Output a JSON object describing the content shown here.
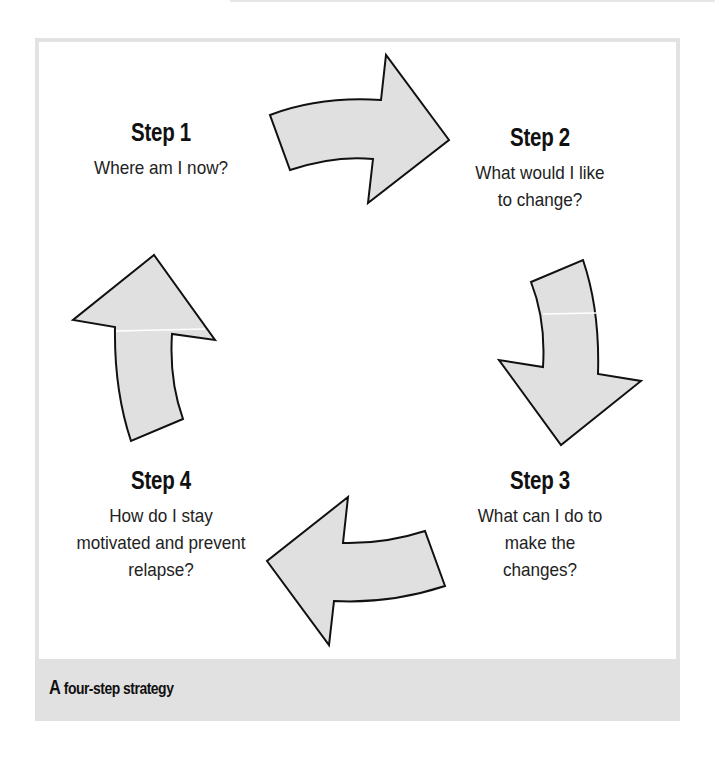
{
  "diagram": {
    "type": "cycle",
    "caption": {
      "lead": "A",
      "rest": " four-step strategy"
    },
    "colors": {
      "frame": "#e2e2e2",
      "caption_band": "#e1e1e1",
      "arrow_fill": "#e0e0e0",
      "arrow_stroke": "#111111"
    },
    "steps": [
      {
        "title": "Step 1",
        "text": "Where am I now?"
      },
      {
        "title": "Step 2",
        "text": "What would I like to change?"
      },
      {
        "title": "Step 3",
        "text": "What can I do to make the changes?"
      },
      {
        "title": "Step 4",
        "text": "How do I stay motivated and prevent relapse?"
      }
    ],
    "arrows": [
      {
        "from": "Step 1",
        "to": "Step 2",
        "direction": "right"
      },
      {
        "from": "Step 2",
        "to": "Step 3",
        "direction": "down"
      },
      {
        "from": "Step 3",
        "to": "Step 4",
        "direction": "left"
      },
      {
        "from": "Step 4",
        "to": "Step 1",
        "direction": "up"
      }
    ]
  }
}
